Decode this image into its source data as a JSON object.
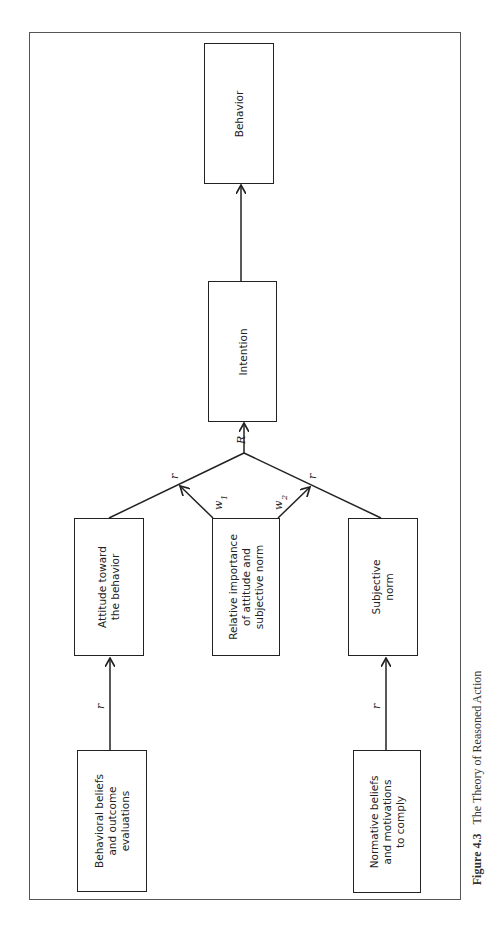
{
  "diagram": {
    "title": "The Theory of Reasoned Action",
    "orientation": "rotated -90deg (flow bottom-to-top)",
    "nodes": [
      {
        "id": "behavioral_beliefs",
        "label": "Behavioral beliefs\nand outcome\nevaluations"
      },
      {
        "id": "normative_beliefs",
        "label": "Normative beliefs\nand motivations\nto comply"
      },
      {
        "id": "attitude",
        "label": "Attitude toward\nthe behavior"
      },
      {
        "id": "relative_importance",
        "label": "Relative importance\nof attitude and\nsubjective norm"
      },
      {
        "id": "subjective_norm",
        "label": "Subjective\nnorm"
      },
      {
        "id": "intention",
        "label": "Intention"
      },
      {
        "id": "behavior",
        "label": "Behavior"
      }
    ],
    "edges": [
      {
        "from": "behavioral_beliefs",
        "to": "attitude",
        "label": "r"
      },
      {
        "from": "normative_beliefs",
        "to": "subjective_norm",
        "label": "r"
      },
      {
        "from": "attitude",
        "to": "intention",
        "label": "r"
      },
      {
        "from": "subjective_norm",
        "to": "intention",
        "label": "r"
      },
      {
        "from": "relative_importance",
        "to": "attitude_edge",
        "label": "w1"
      },
      {
        "from": "relative_importance",
        "to": "subjective_norm_edge",
        "label": "w2"
      },
      {
        "from": "combination",
        "to": "intention",
        "label": "R"
      },
      {
        "from": "intention",
        "to": "behavior",
        "label": ""
      }
    ],
    "edge_labels": {
      "r": "r",
      "R": "R",
      "w1": "w",
      "w1_sub": "1",
      "w2": "w",
      "w2_sub": "2"
    }
  },
  "caption": {
    "figure_number": "Figure 4.3",
    "text": "The Theory of Reasoned Action"
  }
}
